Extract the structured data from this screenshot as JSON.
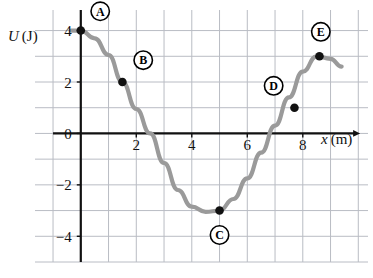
{
  "figure": {
    "name": "potential-energy-vs-position-graph",
    "background_color": "#ffffff",
    "grid_color": "#b9bcc4",
    "axis_color": "#111111",
    "curve_color": "#9a9a9a",
    "marker_color": "#111111"
  },
  "axes": {
    "y_label": "U (J)",
    "y_label_symbol": "U",
    "y_label_unit": "(J)",
    "x_label": "x (m)",
    "x_label_symbol": "x",
    "x_label_unit": "(m)",
    "x_ticks": [
      {
        "value": 2,
        "label": "2"
      },
      {
        "value": 4,
        "label": "4"
      },
      {
        "value": 6,
        "label": "6"
      },
      {
        "value": 8,
        "label": "8"
      }
    ],
    "y_ticks": [
      {
        "value": 4,
        "label": "4"
      },
      {
        "value": 2,
        "label": "2"
      },
      {
        "value": 0,
        "label": "0"
      },
      {
        "value": -2,
        "label": "−2"
      },
      {
        "value": -4,
        "label": "−4"
      }
    ]
  },
  "chart_data": {
    "type": "line",
    "title": "",
    "xlabel": "x (m)",
    "ylabel": "U (J)",
    "xlim": [
      -1.65,
      10.35
    ],
    "ylim": [
      -5.0,
      4.8
    ],
    "grid": true,
    "grid_x_step": 1,
    "grid_y_step": 1,
    "legend": "none",
    "series": [
      {
        "name": "U(x)",
        "color": "#9a9a9a",
        "x": [
          -0.35,
          0.0,
          0.5,
          1.0,
          1.5,
          2.0,
          2.5,
          3.0,
          3.5,
          4.0,
          4.5,
          5.0,
          5.5,
          6.0,
          6.5,
          7.0,
          7.5,
          8.0,
          8.5,
          9.0,
          9.4
        ],
        "y": [
          4.0,
          4.0,
          3.7,
          3.05,
          2.0,
          0.95,
          0.0,
          -1.15,
          -2.2,
          -2.85,
          -3.05,
          -3.0,
          -2.55,
          -1.75,
          -0.75,
          0.3,
          1.4,
          2.4,
          3.0,
          2.9,
          2.6
        ]
      }
    ],
    "points": [
      {
        "id": "A",
        "label": "A",
        "x": 0.0,
        "y": 4.0,
        "label_dx": 0.7,
        "label_dy": 0.75
      },
      {
        "id": "B",
        "label": "B",
        "x": 1.5,
        "y": 2.0,
        "label_dx": 0.75,
        "label_dy": 0.85
      },
      {
        "id": "C",
        "label": "C",
        "x": 5.0,
        "y": -3.0,
        "label_dx": 0.0,
        "label_dy": -0.95
      },
      {
        "id": "D",
        "label": "D",
        "x": 7.7,
        "y": 1.0,
        "label_dx": -0.75,
        "label_dy": 0.85
      },
      {
        "id": "E",
        "label": "E",
        "x": 8.6,
        "y": 3.0,
        "label_dx": 0.05,
        "label_dy": 0.95
      }
    ],
    "annotations": [
      "Point A at x = 0 m, U = 4 J",
      "Point B at x = 1.5 m, U = 2 J",
      "Point C at x = 5 m, U = -3 J (minimum)",
      "Point D at x = 7.7 m, U = 1 J",
      "Point E at x = 8.6 m, U = 3 J (local maximum)"
    ]
  }
}
